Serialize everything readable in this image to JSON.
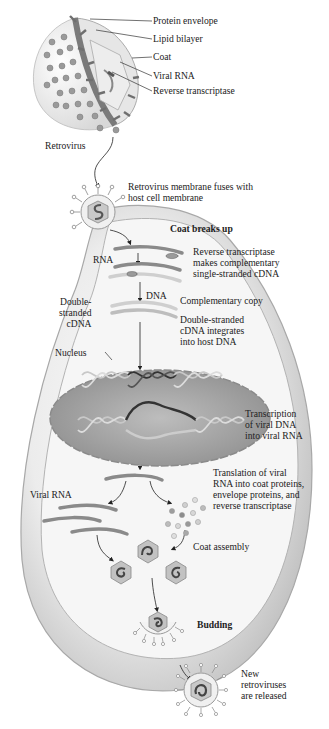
{
  "virion_labels": {
    "protein_envelope": "Protein envelope",
    "lipid_bilayer": "Lipid bilayer",
    "coat": "Coat",
    "viral_rna": "Viral RNA",
    "reverse_transcriptase": "Reverse transcriptase",
    "retrovirus": "Retrovirus"
  },
  "steps": {
    "fusion": "Retrovirus membrane fuses with\nhost cell membrane",
    "coat_breaks": "Coat breaks up",
    "rt_cdna": "Reverse transcriptase\nmakes complementary\nsingle-stranded cDNA",
    "complementary_copy": "Complementary copy",
    "integration": "Double-stranded\ncDNA integrates\ninto host DNA",
    "transcription": "Transcription\nof viral DNA\ninto viral RNA",
    "translation": "Translation of viral\nRNA into coat proteins,\nenvelope proteins, and\nreverse transcriptase",
    "coat_assembly": "Coat assembly",
    "budding": "Budding",
    "release": "New\nretroviruses\nare released"
  },
  "inline_labels": {
    "rna": "RNA",
    "dna": "DNA",
    "ds_cdna": "Double-\nstranded\ncDNA",
    "nucleus": "Nucleus",
    "viral_rna": "Viral RNA"
  },
  "colors": {
    "cell_fill": "#d4d4d4",
    "cell_inner": "#f2f2f2",
    "membrane": "#a9a9a9",
    "nucleus": "#9c9c9c",
    "strand": "#8a8a8a",
    "dark_strand": "#3a3a3a",
    "text": "#222222"
  }
}
